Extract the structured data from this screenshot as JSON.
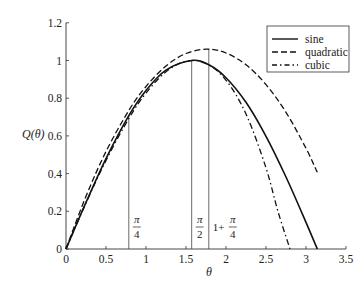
{
  "chart_data": {
    "type": "line",
    "title": "",
    "xlabel": "θ",
    "ylabel": "Q(θ)",
    "xlim": [
      0,
      3.5
    ],
    "ylim": [
      0,
      1.2
    ],
    "x_ticks": [
      "0",
      "0.5",
      "1",
      "1.5",
      "2",
      "2.5",
      "3",
      "3.5"
    ],
    "x_tick_values": [
      0,
      0.5,
      1,
      1.5,
      2,
      2.5,
      3,
      3.5
    ],
    "y_ticks": [
      "0",
      "0.2",
      "0.4",
      "0.6",
      "0.8",
      "1",
      "1.2"
    ],
    "y_tick_values": [
      0,
      0.2,
      0.4,
      0.6,
      0.8,
      1.0,
      1.2
    ],
    "grid": false,
    "legend_position": "upper right",
    "series": [
      {
        "name": "sine",
        "style": "solid",
        "x": [
          0,
          0.25,
          0.5,
          0.785,
          1.0,
          1.25,
          1.571,
          1.785,
          2.0,
          2.25,
          2.5,
          2.75,
          3.0,
          3.1416
        ],
        "values": [
          0,
          0.247,
          0.479,
          0.707,
          0.841,
          0.949,
          1.0,
          0.977,
          0.909,
          0.778,
          0.598,
          0.382,
          0.141,
          0
        ]
      },
      {
        "name": "quadratic",
        "style": "dashed",
        "x": [
          0,
          0.25,
          0.5,
          0.785,
          1.0,
          1.25,
          1.5,
          1.76,
          2.0,
          2.25,
          2.5,
          2.75,
          3.0,
          3.1416
        ],
        "values": [
          0,
          0.28,
          0.517,
          0.735,
          0.862,
          0.971,
          1.037,
          1.06,
          1.04,
          0.977,
          0.872,
          0.725,
          0.534,
          0.407
        ]
      },
      {
        "name": "cubic",
        "style": "dash-dot",
        "x": [
          0,
          0.25,
          0.5,
          0.785,
          1.0,
          1.25,
          1.5,
          1.75,
          2.0,
          2.25,
          2.5,
          2.65,
          2.8
        ],
        "values": [
          0,
          0.244,
          0.47,
          0.692,
          0.827,
          0.94,
          0.996,
          0.985,
          0.895,
          0.716,
          0.43,
          0.199,
          0
        ]
      }
    ],
    "annotations": [
      {
        "label_num": "π",
        "label_den": "4",
        "prefix": "",
        "x": 0.785,
        "top": 0.707
      },
      {
        "label_num": "π",
        "label_den": "2",
        "prefix": "",
        "x": 1.571,
        "top": 1.0
      },
      {
        "label_num": "π",
        "label_den": "4",
        "prefix": "1+",
        "x": 1.785,
        "top": 1.06
      }
    ]
  },
  "legend": {
    "items": [
      {
        "label": "sine",
        "style": "solid"
      },
      {
        "label": "quadratic",
        "style": "dashed"
      },
      {
        "label": "cubic",
        "style": "dash-dot"
      }
    ]
  },
  "colors": {
    "line": "#111111",
    "axis": "#333333",
    "text": "#222222",
    "background": "#ffffff"
  }
}
